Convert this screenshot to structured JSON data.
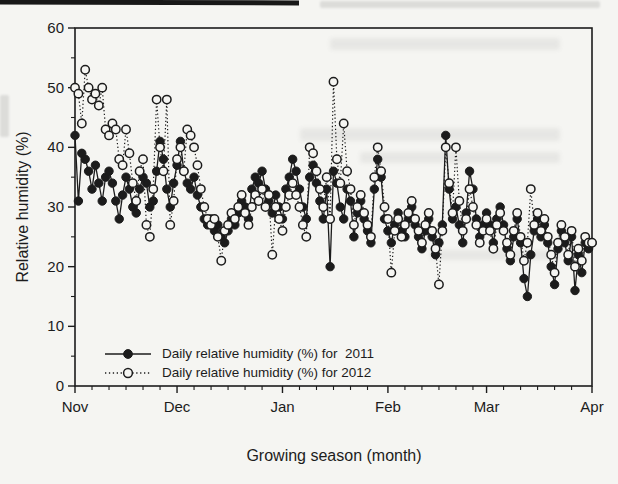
{
  "colors": {
    "ink": "#1c1c1c",
    "paper": "#f5f5f2"
  },
  "chart_data": {
    "type": "line",
    "title": "",
    "xlabel": "Growing season (month)",
    "ylabel": "Relative humidity (%)",
    "x_tick_labels": [
      "Nov",
      "Dec",
      "Jan",
      "Feb",
      "Mar",
      "Apr"
    ],
    "x_tick_days": [
      0,
      30,
      61,
      92,
      121,
      152
    ],
    "x_minor_step_days": 5,
    "y_ticks": [
      0,
      10,
      20,
      30,
      40,
      50,
      60
    ],
    "y_minor_step": 5,
    "ylim": [
      0,
      60
    ],
    "xlim_days": [
      0,
      152
    ],
    "grid": false,
    "legend_position": "inside-lower-left",
    "series": [
      {
        "name": "Daily relative humidity (%) for  2011",
        "marker": "filled-circle",
        "line": "solid",
        "values": [
          42,
          31,
          39,
          38,
          36,
          33,
          37,
          34,
          31,
          35,
          36,
          34,
          31,
          28,
          32,
          35,
          33,
          30,
          29,
          33,
          35,
          34,
          30,
          31,
          36,
          41,
          38,
          33,
          30,
          34,
          37,
          41,
          36,
          34,
          33,
          35,
          32,
          30,
          28,
          27,
          28,
          26,
          27,
          25,
          24,
          26,
          28,
          27,
          29,
          31,
          30,
          28,
          33,
          35,
          34,
          36,
          33,
          31,
          29,
          32,
          30,
          28,
          33,
          35,
          38,
          36,
          33,
          30,
          28,
          35,
          37,
          34,
          31,
          28,
          33,
          20,
          36,
          34,
          30,
          28,
          33,
          31,
          25,
          29,
          31,
          28,
          26,
          24,
          33,
          38,
          35,
          28,
          26,
          24,
          27,
          29,
          26,
          25,
          28,
          30,
          27,
          25,
          23,
          26,
          28,
          25,
          22,
          24,
          27,
          42,
          33,
          28,
          30,
          27,
          24,
          29,
          36,
          33,
          28,
          25,
          27,
          29,
          27,
          24,
          28,
          30,
          27,
          23,
          21,
          25,
          28,
          24,
          18,
          15,
          22,
          26,
          28,
          25,
          27,
          24,
          20,
          17,
          23,
          26,
          24,
          21,
          25,
          16,
          22,
          19,
          24,
          23,
          24
        ]
      },
      {
        "name": "Daily relative humidity (%) for 2012",
        "marker": "open-circle",
        "line": "dotted",
        "values": [
          50,
          49,
          44,
          53,
          50,
          48,
          49,
          47,
          50,
          43,
          42,
          44,
          43,
          38,
          37,
          43,
          39,
          34,
          31,
          36,
          38,
          27,
          25,
          33,
          48,
          40,
          36,
          48,
          27,
          31,
          38,
          40,
          36,
          43,
          42,
          40,
          37,
          33,
          30,
          28,
          27,
          28,
          25,
          21,
          26,
          27,
          29,
          28,
          30,
          32,
          29,
          27,
          30,
          32,
          31,
          33,
          30,
          32,
          22,
          30,
          28,
          26,
          30,
          32,
          34,
          32,
          30,
          27,
          25,
          40,
          39,
          36,
          33,
          30,
          35,
          28,
          51,
          38,
          34,
          44,
          36,
          33,
          27,
          30,
          32,
          29,
          27,
          25,
          35,
          40,
          36,
          30,
          28,
          19,
          26,
          28,
          25,
          27,
          29,
          31,
          28,
          26,
          24,
          27,
          29,
          26,
          23,
          17,
          26,
          40,
          34,
          29,
          40,
          31,
          26,
          28,
          33,
          30,
          27,
          24,
          26,
          28,
          26,
          23,
          27,
          29,
          26,
          24,
          22,
          26,
          29,
          25,
          21,
          24,
          33,
          27,
          29,
          26,
          28,
          25,
          22,
          19,
          24,
          27,
          25,
          22,
          26,
          20,
          23,
          21,
          25,
          24,
          24
        ]
      }
    ]
  }
}
